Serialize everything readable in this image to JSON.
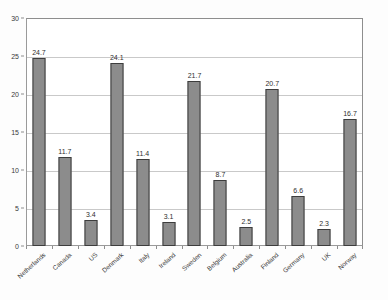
{
  "chart_data": {
    "type": "bar",
    "title": "",
    "subtitle": "",
    "xlabel": "",
    "ylabel": "",
    "ylim": [
      0,
      30
    ],
    "ytick_values": [
      0,
      5,
      10,
      15,
      20,
      25,
      30
    ],
    "ytick_labels": [
      "0",
      "5",
      "10",
      "15",
      "20",
      "25",
      "30"
    ],
    "grid": true,
    "legend": false,
    "legend_position": "none",
    "categories": [
      "Netherlands",
      "Canada",
      "US",
      "Denmark",
      "Italy",
      "Ireland",
      "Sweden",
      "Belgium",
      "Australia",
      "Finland",
      "Germany",
      "UK",
      "Norway"
    ],
    "values": [
      24.7,
      11.7,
      3.4,
      24.1,
      11.4,
      3.1,
      21.7,
      8.7,
      2.5,
      20.7,
      6.6,
      2.3,
      16.7
    ],
    "value_labels": [
      "24.7",
      "11.7",
      "3.4",
      "24.1",
      "11.4",
      "3.1",
      "21.7",
      "8.7",
      "2.5",
      "20.7",
      "6.6",
      "2.3",
      "16.7"
    ],
    "bar_color": "#8c8c8c",
    "bar_border_color": "#3d3d3d",
    "grid_color": "#c9c9c9",
    "axis_color": "#8e8e8e",
    "plot_background": "#ffffff"
  }
}
